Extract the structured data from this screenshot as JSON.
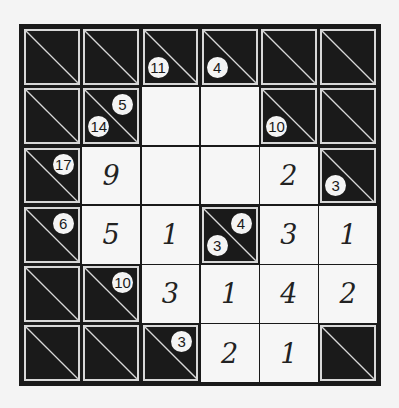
{
  "puzzle": {
    "type": "kakuro",
    "rows": 6,
    "cols": 6,
    "cells": [
      [
        {
          "t": "b"
        },
        {
          "t": "b"
        },
        {
          "t": "c",
          "down": "11"
        },
        {
          "t": "c",
          "down": "4"
        },
        {
          "t": "b"
        },
        {
          "t": "b"
        }
      ],
      [
        {
          "t": "b"
        },
        {
          "t": "c",
          "across": "5",
          "down": "14"
        },
        {
          "t": "w",
          "v": ""
        },
        {
          "t": "w",
          "v": ""
        },
        {
          "t": "c",
          "down": "10"
        },
        {
          "t": "b"
        }
      ],
      [
        {
          "t": "c",
          "across": "17"
        },
        {
          "t": "w",
          "v": "9"
        },
        {
          "t": "w",
          "v": ""
        },
        {
          "t": "w",
          "v": ""
        },
        {
          "t": "w",
          "v": "2"
        },
        {
          "t": "c",
          "down": "3"
        }
      ],
      [
        {
          "t": "c",
          "across": "6"
        },
        {
          "t": "w",
          "v": "5"
        },
        {
          "t": "w",
          "v": "1"
        },
        {
          "t": "c",
          "across": "4",
          "down": "3"
        },
        {
          "t": "w",
          "v": "3"
        },
        {
          "t": "w",
          "v": "1"
        }
      ],
      [
        {
          "t": "b"
        },
        {
          "t": "c",
          "across": "10"
        },
        {
          "t": "w",
          "v": "3"
        },
        {
          "t": "w",
          "v": "1"
        },
        {
          "t": "w",
          "v": "4"
        },
        {
          "t": "w",
          "v": "2"
        }
      ],
      [
        {
          "t": "b"
        },
        {
          "t": "b"
        },
        {
          "t": "c",
          "across": "3"
        },
        {
          "t": "w",
          "v": "2"
        },
        {
          "t": "w",
          "v": "1"
        },
        {
          "t": "b"
        }
      ]
    ]
  },
  "colors": {
    "black": "#1a1a1a",
    "white": "#f6f6f6",
    "diagonal": "#d8d8d8"
  }
}
